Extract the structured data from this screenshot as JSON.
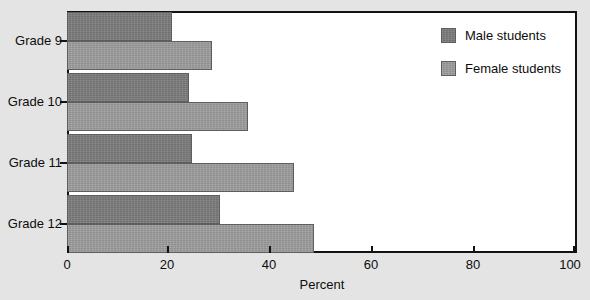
{
  "chart_data": {
    "type": "bar",
    "orientation": "horizontal",
    "title": "",
    "xlabel": "Percent",
    "ylabel": "",
    "xlim": [
      0,
      100
    ],
    "xticks": [
      0,
      20,
      40,
      60,
      80,
      100
    ],
    "xtick_labels": [
      "0",
      "20",
      "40",
      "60",
      "80",
      "100"
    ],
    "grid": false,
    "legend_position": "top-right",
    "categories": [
      "Grade 9",
      "Grade 10",
      "Grade 11",
      "Grade 12"
    ],
    "series": [
      {
        "name": "Male students",
        "color": "#7c7c7c",
        "values": [
          20.5,
          24,
          24.5,
          30
        ]
      },
      {
        "name": "Female students",
        "color": "#9e9e9e",
        "values": [
          28.5,
          35.5,
          44.5,
          48.5
        ]
      }
    ]
  },
  "legend": {
    "items": [
      {
        "label": "Male students",
        "swatch": "male-swatch"
      },
      {
        "label": "Female students",
        "swatch": "female-swatch"
      }
    ]
  },
  "colors": {
    "background": "#e4e4e4",
    "plot_background": "#ffffff",
    "axis": "#121212",
    "male": "#7c7c7c",
    "female": "#9e9e9e"
  }
}
